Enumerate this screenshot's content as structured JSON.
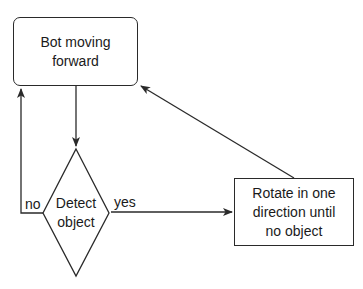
{
  "diagram": {
    "type": "flowchart",
    "nodes": {
      "start": {
        "id": "start",
        "shape": "rounded-rectangle",
        "line1": "Bot moving",
        "line2": "forward"
      },
      "decision": {
        "id": "decision",
        "shape": "diamond",
        "line1": "Detect",
        "line2": "object"
      },
      "rotate": {
        "id": "rotate",
        "shape": "rectangle",
        "line1": "Rotate in one",
        "line2": "direction until",
        "line3": "no object"
      }
    },
    "edges": {
      "start_to_decision": {
        "from": "start",
        "to": "decision",
        "label": ""
      },
      "decision_no": {
        "from": "decision",
        "to": "start",
        "label": "no"
      },
      "decision_yes": {
        "from": "decision",
        "to": "rotate",
        "label": "yes"
      },
      "rotate_to_start": {
        "from": "rotate",
        "to": "start",
        "label": ""
      }
    },
    "colors": {
      "stroke": "#2a2a2a",
      "text": "#1a1a1a",
      "background": "#ffffff"
    }
  }
}
